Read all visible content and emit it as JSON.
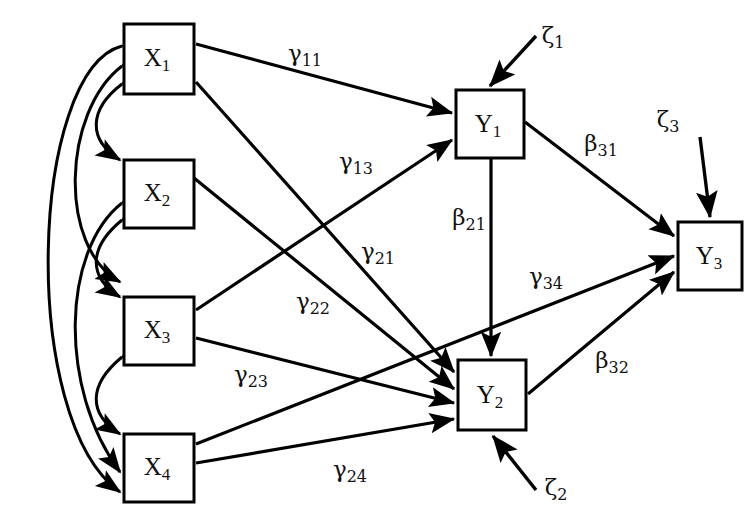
{
  "diagram": {
    "type": "path-diagram",
    "background_color": "#ffffff",
    "line_color": "#000000",
    "nodes": [
      {
        "id": "X1",
        "base": "X",
        "sub": "1",
        "x": 124,
        "y": 24,
        "w": 70,
        "h": 70,
        "kind": "exogenous"
      },
      {
        "id": "X2",
        "base": "X",
        "sub": "2",
        "x": 124,
        "y": 160,
        "w": 70,
        "h": 68,
        "kind": "exogenous"
      },
      {
        "id": "X3",
        "base": "X",
        "sub": "3",
        "x": 124,
        "y": 297,
        "w": 70,
        "h": 68,
        "kind": "exogenous"
      },
      {
        "id": "X4",
        "base": "X",
        "sub": "4",
        "x": 124,
        "y": 434,
        "w": 70,
        "h": 68,
        "kind": "exogenous"
      },
      {
        "id": "Y1",
        "base": "Y",
        "sub": "1",
        "x": 456,
        "y": 90,
        "w": 68,
        "h": 68,
        "kind": "endogenous"
      },
      {
        "id": "Y2",
        "base": "Y",
        "sub": "2",
        "x": 458,
        "y": 360,
        "w": 68,
        "h": 70,
        "kind": "endogenous"
      },
      {
        "id": "Y3",
        "base": "Y",
        "sub": "3",
        "x": 678,
        "y": 222,
        "w": 64,
        "h": 68,
        "kind": "endogenous"
      }
    ],
    "disturbances": [
      {
        "id": "z1",
        "base": "ζ",
        "sub": "1",
        "label_x": 553,
        "label_y": 37,
        "target": "Y1"
      },
      {
        "id": "z2",
        "base": "ζ",
        "sub": "2",
        "label_x": 556,
        "label_y": 489,
        "target": "Y2"
      },
      {
        "id": "z3",
        "base": "ζ",
        "sub": "3",
        "label_x": 668,
        "label_y": 121,
        "target": "Y3"
      }
    ],
    "paths": [
      {
        "id": "g11",
        "base": "γ",
        "sub": "11",
        "from": "X1",
        "to": "Y1",
        "label_x": 305,
        "label_y": 55
      },
      {
        "id": "g13",
        "base": "γ",
        "sub": "13",
        "from": "X3",
        "to": "Y1",
        "label_x": 356,
        "label_y": 163
      },
      {
        "id": "g21",
        "base": "γ",
        "sub": "21",
        "from": "X1",
        "to": "Y2",
        "label_x": 378,
        "label_y": 253
      },
      {
        "id": "g22",
        "base": "γ",
        "sub": "22",
        "from": "X2",
        "to": "Y2",
        "label_x": 313,
        "label_y": 303
      },
      {
        "id": "g23",
        "base": "γ",
        "sub": "23",
        "from": "X3",
        "to": "Y2",
        "label_x": 251,
        "label_y": 376
      },
      {
        "id": "g24",
        "base": "γ",
        "sub": "24",
        "from": "X4",
        "to": "Y2",
        "label_x": 350,
        "label_y": 471
      },
      {
        "id": "g34",
        "base": "γ",
        "sub": "34",
        "from": "X4",
        "to": "Y3",
        "label_x": 546,
        "label_y": 278
      },
      {
        "id": "b21",
        "base": "β",
        "sub": "21",
        "from": "Y1",
        "to": "Y2",
        "label_x": 469,
        "label_y": 219
      },
      {
        "id": "b31",
        "base": "β",
        "sub": "31",
        "from": "Y1",
        "to": "Y3",
        "label_x": 601,
        "label_y": 145
      },
      {
        "id": "b32",
        "base": "β",
        "sub": "32",
        "from": "Y2",
        "to": "Y3",
        "label_x": 612,
        "label_y": 362
      }
    ],
    "correlations": [
      {
        "id": "c12",
        "between": [
          "X1",
          "X2"
        ]
      },
      {
        "id": "c23",
        "between": [
          "X2",
          "X3"
        ]
      },
      {
        "id": "c34",
        "between": [
          "X3",
          "X4"
        ]
      },
      {
        "id": "c13",
        "between": [
          "X1",
          "X3"
        ]
      },
      {
        "id": "c24",
        "between": [
          "X2",
          "X4"
        ]
      },
      {
        "id": "c14",
        "between": [
          "X1",
          "X4"
        ]
      }
    ]
  }
}
